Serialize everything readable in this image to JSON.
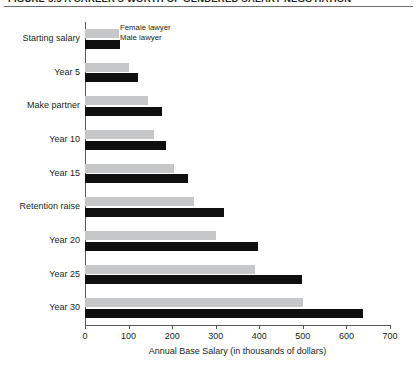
{
  "figure": {
    "caption": "FIGURE 5.5    A CAREER'S WORTH OF GENDERED SALARY NEGOTIATION"
  },
  "chart_data": {
    "type": "bar",
    "orientation": "horizontal",
    "title": "A CAREER'S WORTH OF GENDERED SALARY NEGOTIATION",
    "xlabel": "Annual Base Salary (in thousands of dollars)",
    "ylabel": "",
    "xlim": [
      0,
      700
    ],
    "xticks": [
      0,
      100,
      200,
      300,
      400,
      500,
      600,
      700
    ],
    "grid": false,
    "legend_position": "top-left-inside",
    "categories": [
      "Starting salary",
      "Year 5",
      "Make partner",
      "Year 10",
      "Year 15",
      "Retention raise",
      "Year 20",
      "Year 25",
      "Year 30"
    ],
    "series": [
      {
        "name": "Female lawyer",
        "color": "#c6c7c9",
        "values": [
          78,
          101,
          145,
          159,
          205,
          250,
          301,
          391,
          501
        ]
      },
      {
        "name": "Male lawyer",
        "color": "#0f0f0f",
        "values": [
          80,
          122,
          177,
          186,
          237,
          319,
          398,
          499,
          637
        ]
      }
    ]
  }
}
